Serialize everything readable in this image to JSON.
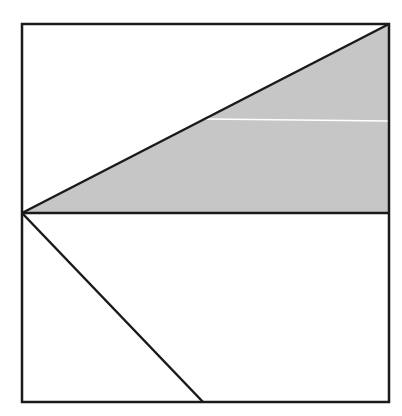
{
  "diagram": {
    "colors": {
      "stroke": "#1a1a1a",
      "shade": "#c6c6c6",
      "background": "#ffffff",
      "artifact_line": "#ffffff"
    },
    "square": {
      "x": 22,
      "y": 24,
      "width": 367,
      "height": 378
    },
    "midline": {
      "x1": 22,
      "y1": 213,
      "x2": 389,
      "y2": 213
    },
    "shaded_triangle": {
      "points": [
        [
          22,
          213
        ],
        [
          389,
          24
        ],
        [
          389,
          213
        ]
      ]
    },
    "lower_diagonal": {
      "x1": 22,
      "y1": 213,
      "x2": 203,
      "y2": 402
    },
    "artifact_line": {
      "x1": 205,
      "y1": 119,
      "x2": 389,
      "y2": 121
    }
  }
}
